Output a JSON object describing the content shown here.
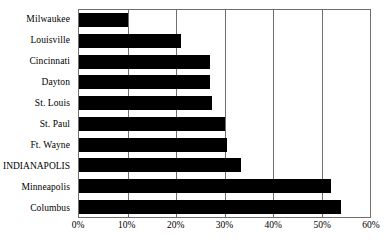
{
  "chart_data": {
    "type": "bar",
    "orientation": "horizontal",
    "title": "",
    "subtitle": "",
    "xlabel": "",
    "ylabel": "",
    "xlim": [
      0,
      60
    ],
    "xtick_labels": [
      "0%",
      "10%",
      "20%",
      "30%",
      "40%",
      "50%",
      "60%"
    ],
    "xticks": [
      0,
      10,
      20,
      30,
      40,
      50,
      60
    ],
    "xtick_suffix": "%",
    "grid": true,
    "grid_axis": "x",
    "legend": false,
    "legend_position": "none",
    "bar_color": "#000000",
    "plot_background": "#ffffff",
    "axis_color": "#6f6f6f",
    "categories": [
      "Milwaukee",
      "Louisville",
      "Cincinnati",
      "Dayton",
      "St. Louis",
      "St. Paul",
      "Ft. Wayne",
      "INDIANAPOLIS",
      "Minneapolis",
      "Columbus"
    ],
    "values": [
      10,
      21,
      27,
      27,
      27.5,
      30,
      30.5,
      33.5,
      52,
      54
    ],
    "highlight_category": "INDIANAPOLIS",
    "series": [
      {
        "name": "",
        "values": [
          10,
          21,
          27,
          27,
          27.5,
          30,
          30.5,
          33.5,
          52,
          54
        ]
      }
    ]
  }
}
